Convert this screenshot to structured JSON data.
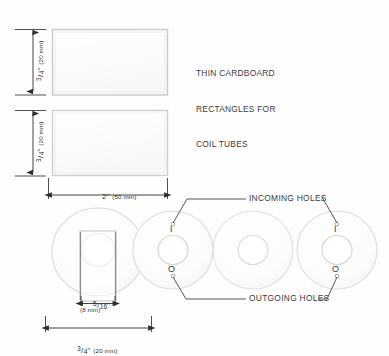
{
  "diagram": {
    "title_note": {
      "lines": [
        "THIN CARDBOARD",
        "RECTANGLES FOR",
        "COIL TUBES"
      ]
    },
    "callouts": {
      "incoming": "INCOMING HOLES",
      "outgoing": "OUTGOING HOLES"
    },
    "dimensions": {
      "rect1_height": {
        "fraction_num": "3",
        "fraction_bar": "/",
        "fraction_den": "4",
        "unit_mark": "\"",
        "metric": "(20 mm)"
      },
      "rect2_height": {
        "fraction_num": "3",
        "fraction_bar": "/",
        "fraction_den": "4",
        "unit_mark": "\"",
        "metric": "(20 mm)"
      },
      "rect_width": {
        "value": "2\"",
        "metric": "(50 mm)"
      },
      "tube_inner": {
        "fraction_num": "5",
        "fraction_bar": "/",
        "fraction_den": "16",
        "unit_mark": "\"",
        "metric": "(8 mm)"
      },
      "disc_width": {
        "fraction_num": "3",
        "fraction_bar": "/",
        "fraction_den": "4",
        "unit_mark": "\"",
        "metric": "(20 mm)"
      }
    },
    "discs": [
      {
        "name": "coil-tube-assembly",
        "incoming_label": "",
        "outgoing_label": ""
      },
      {
        "name": "washer-left",
        "incoming_label": "I",
        "outgoing_label": "O"
      },
      {
        "name": "washer-middle",
        "incoming_label": "",
        "outgoing_label": ""
      },
      {
        "name": "washer-right",
        "incoming_label": "I",
        "outgoing_label": "O"
      }
    ],
    "colors": {
      "line": "#6f6f6f",
      "dim_line": "#2f2f2f",
      "fill": "#fdfdfd",
      "text": "#3a3a3a"
    }
  }
}
